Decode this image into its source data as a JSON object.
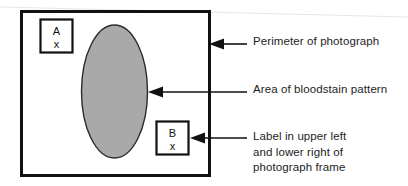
{
  "figure": {
    "colors": {
      "stain_fill": "#a9a9a9",
      "stain_stroke": "#2b2b2b",
      "frame_stroke": "#111111",
      "label_box_stroke": "#111111",
      "arrow": "#111111",
      "background": "#ffffff",
      "text": "#1d1d1d"
    }
  },
  "photograph": {
    "name": "photograph-frame",
    "perimeter": {
      "x": 21,
      "y": 11,
      "width": 189,
      "height": 165
    },
    "stain": {
      "name": "bloodstain-pattern",
      "shape": "ellipse",
      "cx": 114.5,
      "cy": 91.5,
      "rx": 33,
      "ry": 66.5
    },
    "label_boxes": [
      {
        "name": "label-box-a",
        "position": "upper left",
        "letter": "A",
        "mark": "x",
        "x": 40,
        "y": 19,
        "width": 33,
        "height": 34
      },
      {
        "name": "label-box-b",
        "position": "lower right",
        "letter": "B",
        "mark": "x",
        "x": 156,
        "y": 121,
        "width": 33,
        "height": 34
      }
    ]
  },
  "callouts": [
    {
      "id": "perimeter",
      "text": "Perimeter of photograph",
      "arrow": {
        "tip_x": 209,
        "tail_x": 247,
        "y": 44
      }
    },
    {
      "id": "area",
      "text": "Area of bloodstain pattern",
      "arrow": {
        "tip_x": 148,
        "tail_x": 247,
        "y": 92
      }
    },
    {
      "id": "corner",
      "text": "Label in upper left\nand lower right of\nphotograph frame",
      "arrow": {
        "tip_x": 190,
        "tail_x": 247,
        "y": 138
      }
    }
  ]
}
